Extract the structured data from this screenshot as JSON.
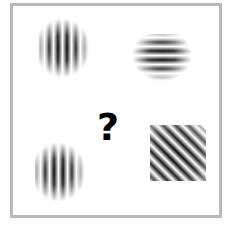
{
  "puzzle": {
    "question_mark": "?",
    "frame_color": "#b8b8b8",
    "stimuli": [
      {
        "id": "top-left",
        "type": "gabor-patch",
        "orientation": "vertical",
        "angle_deg": 0,
        "cx": 67,
        "cy": 48
      },
      {
        "id": "top-right",
        "type": "gabor-patch",
        "orientation": "horizontal",
        "angle_deg": 90,
        "cx": 162,
        "cy": 60
      },
      {
        "id": "bottom-left",
        "type": "gabor-patch",
        "orientation": "vertical",
        "angle_deg": 0,
        "cx": 63,
        "cy": 172
      },
      {
        "id": "bottom-right",
        "type": "gabor-patch",
        "orientation": "diagonal",
        "angle_deg": -45,
        "cx": 178,
        "cy": 153
      }
    ]
  }
}
